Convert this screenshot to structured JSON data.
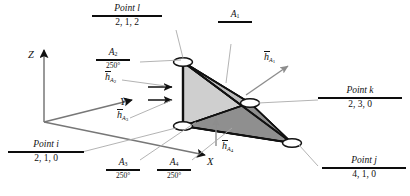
{
  "figure": {
    "axes": {
      "z": "Z",
      "y": "Y",
      "x": "X"
    },
    "colors": {
      "face_light": "#c9c9c9",
      "face_mid": "#b0b0b0",
      "face_dark": "#8a8a8a",
      "edge": "#111111",
      "leader": "#9a9a9a",
      "rule": "#0d0d0d",
      "background": "#ffffff"
    }
  },
  "points": [
    {
      "id": "point-l",
      "name": "Point l",
      "coords": "2, 1, 2"
    },
    {
      "id": "point-k",
      "name": "Point k",
      "coords": "2, 3, 0"
    },
    {
      "id": "point-j",
      "name": "Point j",
      "coords": "4, 1, 0"
    },
    {
      "id": "point-i",
      "name": "Point i",
      "coords": "2, 1, 0"
    }
  ],
  "areas": [
    {
      "id": "a1",
      "name": "A",
      "index": "1",
      "value": ""
    },
    {
      "id": "a2",
      "name": "A",
      "index": "2",
      "value": "250°"
    },
    {
      "id": "a3",
      "name": "A",
      "index": "3",
      "value": "250°"
    },
    {
      "id": "a4",
      "name": "A",
      "index": "4",
      "value": "250°"
    }
  ],
  "vectors": [
    {
      "id": "h-a1",
      "symbol": "h",
      "index": "1"
    },
    {
      "id": "h-a2",
      "symbol": "h",
      "index": "2"
    },
    {
      "id": "h-a3",
      "symbol": "h",
      "index": "3"
    },
    {
      "id": "h-a4",
      "symbol": "h",
      "index": "4"
    }
  ]
}
